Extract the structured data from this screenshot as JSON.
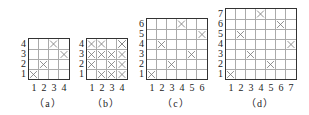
{
  "figure": {
    "panels": [
      {
        "id": "a",
        "caption": "（a）",
        "size": 4,
        "left": 28,
        "top": 38,
        "cell": 10,
        "caption_x": 48,
        "x_labels": [
          "1",
          "2",
          "3",
          "4"
        ],
        "y_labels": [
          "1",
          "2",
          "3",
          "4"
        ],
        "marks": [
          [
            1,
            1
          ],
          [
            2,
            2
          ],
          [
            4,
            3
          ],
          [
            3,
            4
          ]
        ]
      },
      {
        "id": "b",
        "caption": "（b）",
        "size": 4,
        "left": 86,
        "top": 38,
        "cell": 10,
        "caption_x": 106,
        "x_labels": [
          "1",
          "2",
          "3",
          "4"
        ],
        "y_labels": [
          "1",
          "2",
          "3",
          "4"
        ],
        "marks": [
          [
            2,
            1
          ],
          [
            3,
            1
          ],
          [
            4,
            1
          ],
          [
            1,
            2
          ],
          [
            3,
            2
          ],
          [
            4,
            2
          ],
          [
            1,
            3
          ],
          [
            2,
            3
          ],
          [
            3,
            3
          ],
          [
            4,
            3
          ],
          [
            1,
            4
          ],
          [
            2,
            4
          ],
          [
            4,
            4
          ]
        ]
      },
      {
        "id": "c",
        "caption": "（c）",
        "size": 6,
        "left": 146,
        "top": 18,
        "cell": 10,
        "caption_x": 176,
        "x_labels": [
          "1",
          "2",
          "3",
          "4",
          "5",
          "6"
        ],
        "y_labels": [
          "1",
          "2",
          "3",
          "4",
          "5",
          "6"
        ],
        "marks": [
          [
            1,
            1
          ],
          [
            3,
            2
          ],
          [
            5,
            3
          ],
          [
            2,
            4
          ],
          [
            6,
            5
          ],
          [
            4,
            6
          ]
        ]
      },
      {
        "id": "d",
        "caption": "（d）",
        "size": 7,
        "left": 225,
        "top": 8,
        "cell": 10,
        "caption_x": 260,
        "x_labels": [
          "1",
          "2",
          "3",
          "4",
          "5",
          "6",
          "7"
        ],
        "y_labels": [
          "1",
          "2",
          "3",
          "4",
          "5",
          "6",
          "7"
        ],
        "marks": [
          [
            1,
            1
          ],
          [
            5,
            2
          ],
          [
            3,
            3
          ],
          [
            7,
            4
          ],
          [
            2,
            5
          ],
          [
            6,
            6
          ],
          [
            4,
            7
          ]
        ]
      }
    ],
    "colors": {
      "border": "#333333",
      "grid_line": "#aaaaaa",
      "mark": "#777777",
      "text": "#222222"
    }
  }
}
